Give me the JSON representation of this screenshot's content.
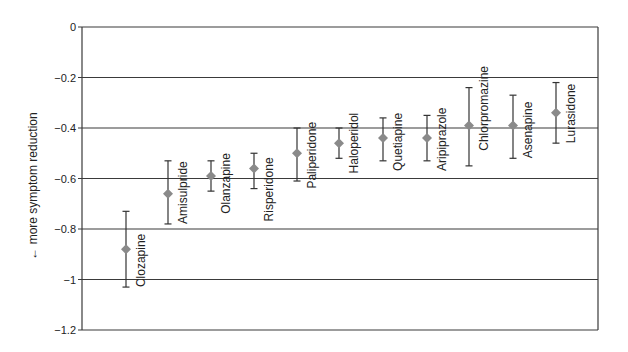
{
  "chart_data": {
    "type": "scatter",
    "subtype": "point-estimate-with-error-bars",
    "title": "",
    "xlabel": "",
    "ylabel": "← more symptom reduction",
    "ylim": [
      -1.2,
      0
    ],
    "yticks": [
      0,
      -0.2,
      -0.4,
      -0.6,
      -0.8,
      -1,
      -1.2
    ],
    "ytick_labels": [
      "0",
      "-0.2",
      "-0.4",
      "-0.6",
      "-0.8",
      "-1",
      "-1.2"
    ],
    "grid": {
      "horizontal": true,
      "vertical": false
    },
    "legend": null,
    "marker": {
      "shape": "diamond",
      "color": "#8a8a8a"
    },
    "errorbar_color": "#333333",
    "gridline_color": "#3a3a3a",
    "categories": [
      "Clozapine",
      "Amisulpride",
      "Olanzapine",
      "Risperidone",
      "Paliperidone",
      "Haloperidol",
      "Quetiapine",
      "Aripiprazole",
      "Chlorpromazine",
      "Asenapine",
      "Lurasidone"
    ],
    "points": [
      {
        "name": "Clozapine",
        "value": -0.88,
        "lower": -1.03,
        "upper": -0.73,
        "label_low": -1.03
      },
      {
        "name": "Amisulpride",
        "value": -0.66,
        "lower": -0.78,
        "upper": -0.53,
        "label_low": -0.78
      },
      {
        "name": "Olanzapine",
        "value": -0.59,
        "lower": -0.65,
        "upper": -0.53,
        "label_low": -0.74
      },
      {
        "name": "Risperidone",
        "value": -0.56,
        "lower": -0.64,
        "upper": -0.5,
        "label_low": -0.77
      },
      {
        "name": "Paliperidone",
        "value": -0.5,
        "lower": -0.61,
        "upper": -0.4,
        "label_low": -0.64
      },
      {
        "name": "Haloperidol",
        "value": -0.46,
        "lower": -0.52,
        "upper": -0.4,
        "label_low": -0.58
      },
      {
        "name": "Quetiapine",
        "value": -0.44,
        "lower": -0.53,
        "upper": -0.36,
        "label_low": -0.57
      },
      {
        "name": "Aripiprazole",
        "value": -0.44,
        "lower": -0.53,
        "upper": -0.35,
        "label_low": -0.57
      },
      {
        "name": "Chlorpromazine",
        "value": -0.39,
        "lower": -0.55,
        "upper": -0.24,
        "label_low": -0.49
      },
      {
        "name": "Asenapine",
        "value": -0.39,
        "lower": -0.52,
        "upper": -0.27,
        "label_low": -0.52
      },
      {
        "name": "Lurasidone",
        "value": -0.34,
        "lower": -0.46,
        "upper": -0.22,
        "label_low": -0.46
      }
    ]
  },
  "layout_px": {
    "plot_left": 82,
    "plot_right": 598,
    "y_zero": 27,
    "y_min": 330,
    "x_positions": [
      126,
      168,
      211,
      254,
      297,
      339,
      383,
      427,
      469,
      513,
      556
    ],
    "label_offset_x": 19
  }
}
